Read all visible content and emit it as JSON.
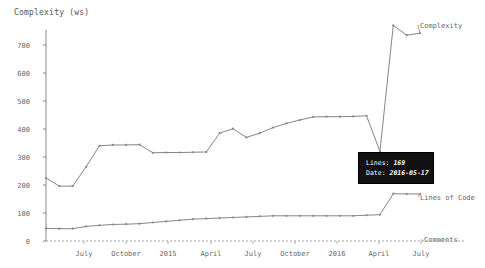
{
  "chart_title": "Complexity (ws)",
  "axis": {
    "y_label": "Complexity (ws)",
    "y_ticks": [
      "0",
      "100",
      "200",
      "300",
      "400",
      "500",
      "600",
      "700"
    ],
    "x_ticks": [
      "July",
      "October",
      "2015",
      "April",
      "July",
      "October",
      "2016",
      "April",
      "July"
    ]
  },
  "legend": {
    "complexity_label": "Complexity",
    "lines_of_code_label": "Lines of Code",
    "comments_label": "Comments"
  },
  "tooltip": {
    "lines_key": "Lines:",
    "lines_value": "169",
    "date_key": "Date:",
    "date_value": "2016-05-17"
  },
  "colors": {
    "line": "#777777",
    "axis": "#888888",
    "text": "#666666",
    "tooltip_bg": "#111111",
    "tooltip_text": "#ffffff"
  },
  "chart_data": {
    "type": "line",
    "title": "Complexity (ws)",
    "xlabel": "",
    "ylabel": "Complexity (ws)",
    "ylim": [
      0,
      790
    ],
    "grid": false,
    "legend_position": "right-inline",
    "x_tick_labels": [
      "July",
      "October",
      "2015",
      "April",
      "July",
      "October",
      "2016",
      "April",
      "July"
    ],
    "y_tick_values": [
      0,
      100,
      200,
      300,
      400,
      500,
      600,
      700
    ],
    "x": [
      "2014-05-20",
      "2014-06-17",
      "2014-07-15",
      "2014-08-19",
      "2014-09-16",
      "2014-10-14",
      "2014-11-18",
      "2014-12-16",
      "2015-01-20",
      "2015-02-17",
      "2015-03-17",
      "2015-04-21",
      "2015-05-19",
      "2015-06-16",
      "2015-07-21",
      "2015-08-18",
      "2015-09-15",
      "2015-10-20",
      "2015-11-17",
      "2015-12-15",
      "2016-01-19",
      "2016-02-16",
      "2016-03-15",
      "2016-04-19",
      "2016-05-10",
      "2016-05-17",
      "2016-06-14",
      "2016-07-05",
      "2016-07-19"
    ],
    "series": [
      {
        "name": "Complexity",
        "values": [
          225,
          196,
          196,
          265,
          340,
          343,
          343,
          344,
          315,
          316,
          316,
          317,
          318,
          385,
          401,
          370,
          385,
          405,
          420,
          432,
          443,
          444,
          444,
          445,
          447,
          320,
          770,
          735,
          742
        ]
      },
      {
        "name": "Lines of Code",
        "values": [
          45,
          44,
          44,
          52,
          56,
          59,
          60,
          62,
          66,
          70,
          74,
          78,
          80,
          82,
          84,
          86,
          88,
          90,
          90,
          90,
          90,
          90,
          90,
          90,
          92,
          94,
          169,
          168,
          168
        ]
      },
      {
        "name": "Comments",
        "values": [
          0,
          0,
          0,
          0,
          0,
          0,
          0,
          0,
          0,
          0,
          0,
          0,
          0,
          0,
          0,
          0,
          0,
          0,
          0,
          0,
          0,
          0,
          0,
          0,
          0,
          0,
          0,
          0,
          0
        ]
      }
    ]
  }
}
